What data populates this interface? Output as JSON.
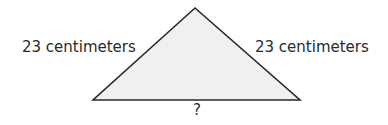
{
  "diagram": {
    "type": "isosceles-triangle",
    "fill": "#f0f0f0",
    "stroke": "#2a2a2a",
    "labels": {
      "left_side": "23 centimeters",
      "right_side": "23 centimeters",
      "base": "?"
    }
  }
}
